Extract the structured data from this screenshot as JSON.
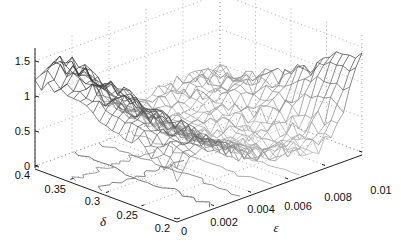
{
  "chart_data": {
    "type": "surface3d",
    "title": "",
    "xlabel": "ε",
    "ylabel": "δ",
    "zlabel": "",
    "x_axis": {
      "label": "ε",
      "range": [
        0,
        0.01
      ],
      "ticks": [
        "0",
        "0.002",
        "0.004",
        "0.006",
        "0.008",
        "0.01"
      ]
    },
    "y_axis": {
      "label": "δ",
      "range": [
        0.2,
        0.4
      ],
      "ticks": [
        "0.2",
        "0.25",
        "0.3",
        "0.35",
        "0.4"
      ]
    },
    "z_axis": {
      "label": "",
      "range": [
        0,
        1.7
      ],
      "ticks": [
        "0",
        "0.5",
        "1",
        "1.5"
      ]
    },
    "grid": true,
    "grid_style": "dotted",
    "surface_style": "grayscale wireframe mesh with contour projection on base plane",
    "approx_grid": {
      "eps": [
        0,
        0.002,
        0.004,
        0.006,
        0.008,
        0.01
      ],
      "delta": [
        0.2,
        0.25,
        0.3,
        0.35,
        0.4
      ],
      "z": [
        [
          0.55,
          0.45,
          0.4,
          0.5,
          0.8,
          1.4
        ],
        [
          0.7,
          0.5,
          0.4,
          0.45,
          0.6,
          1.0
        ],
        [
          1.0,
          0.7,
          0.45,
          0.4,
          0.5,
          0.75
        ],
        [
          1.35,
          1.1,
          0.6,
          0.45,
          0.45,
          0.6
        ],
        [
          1.45,
          1.25,
          0.8,
          0.5,
          0.45,
          0.55
        ]
      ]
    }
  },
  "labels": {
    "z_ticks": [
      "0",
      "0.5",
      "1",
      "1.5"
    ],
    "y_ticks": [
      "0.4",
      "0.35",
      "0.3",
      "0.25",
      "0.2"
    ],
    "x_ticks": [
      "0",
      "0.002",
      "0.004",
      "0.006",
      "0.008",
      "0.01"
    ],
    "x_label": "ε",
    "y_label": "δ"
  }
}
